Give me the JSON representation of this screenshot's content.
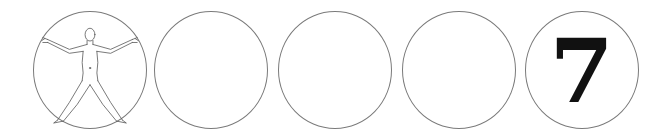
{
  "sequence": {
    "items": [
      {
        "type": "image",
        "icon": "human-figure-icon",
        "label": ""
      },
      {
        "type": "empty",
        "label": ""
      },
      {
        "type": "empty",
        "label": ""
      },
      {
        "type": "empty",
        "label": ""
      },
      {
        "type": "numeral",
        "label": "7"
      }
    ],
    "colors": {
      "circle_border": "#7a7a7a",
      "numeral": "#111111",
      "background": "#ffffff"
    }
  }
}
